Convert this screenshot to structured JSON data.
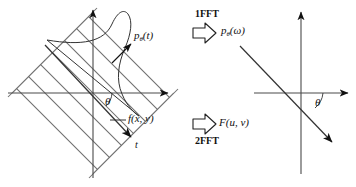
{
  "figure": {
    "left_panel": {
      "name": "spatial-domain-panel",
      "object_label": "f(x, y)",
      "projection_label_p": "p",
      "projection_label_sub": "θ",
      "projection_label_arg": "(t)",
      "angle_label": "θ",
      "t_axis_label": "t"
    },
    "right_panel": {
      "name": "frequency-domain-panel",
      "angle_label": "θ"
    },
    "transforms": [
      {
        "name": "one-dimensional-fft",
        "caption": "1FFT",
        "caption_position": "above",
        "result_label_p": "p",
        "result_label_sub": "θ",
        "result_label_arg": "(ω)"
      },
      {
        "name": "two-dimensional-fft",
        "caption": "2FFT",
        "caption_position": "below",
        "result_label_main": "F",
        "result_label_arg": "(u, v)"
      }
    ],
    "colors": {
      "ink": "#111111",
      "hatch": "#6e6e6e",
      "axis": "#4a4a4a"
    }
  }
}
